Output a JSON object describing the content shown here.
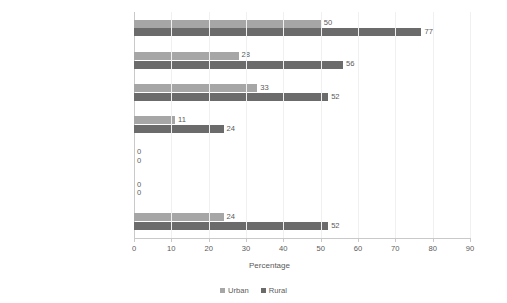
{
  "chart_data": {
    "type": "bar",
    "orientation": "horizontal",
    "title": "",
    "xlabel": "Percentage",
    "ylabel": "",
    "xlim": [
      0,
      90
    ],
    "xticks": [
      0,
      10,
      20,
      30,
      40,
      50,
      60,
      70,
      80,
      90
    ],
    "grid": true,
    "legend_position": "bottom",
    "categories": [
      "Africa",
      "Middle East",
      "Asia and Pacific",
      "Latin America and  Carribean",
      "Europe",
      "North America",
      "World"
    ],
    "series": [
      {
        "name": "Urban",
        "color": "#a6a6a6",
        "values": [
          50,
          28,
          33,
          11,
          0,
          0,
          24
        ]
      },
      {
        "name": "Rural",
        "color": "#6b6b6b",
        "values": [
          77,
          56,
          52,
          24,
          0,
          0,
          52
        ]
      }
    ]
  },
  "axis": {
    "x_title": "Percentage"
  },
  "legend": {
    "items": [
      {
        "label": "Urban"
      },
      {
        "label": "Rural"
      }
    ]
  },
  "colors": {
    "urban": "#a6a6a6",
    "rural": "#6b6b6b",
    "axis": "#c9c9c9",
    "grid": "#f0f0f0",
    "text": "#5a5a5a",
    "background": "#ffffff"
  }
}
